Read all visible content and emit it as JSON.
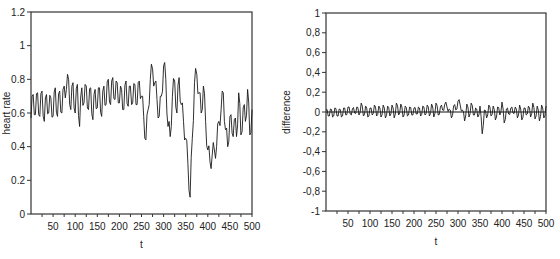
{
  "chart_data": [
    {
      "type": "line",
      "id": "heart-rate",
      "title": "",
      "xlabel": "t",
      "ylabel": "heart rate",
      "xlim": [
        0,
        500
      ],
      "ylim": [
        0,
        1.2
      ],
      "xticks": [
        50,
        100,
        150,
        200,
        250,
        300,
        350,
        400,
        450,
        500
      ],
      "xminor_step": 25,
      "yticks": [
        0,
        0.2,
        0.4,
        0.6,
        0.8,
        1,
        1.2
      ],
      "ytick_labels": [
        "0",
        "0.2",
        "0.4",
        "0.6",
        "0.8",
        "1",
        "1.2"
      ],
      "grid": false,
      "frame": {
        "left": 31,
        "top": 12,
        "right": 252,
        "bottom": 214
      },
      "series": [
        {
          "name": "heart rate",
          "x": [
            0,
            5,
            10,
            15,
            20,
            25,
            30,
            35,
            40,
            45,
            50,
            55,
            60,
            65,
            70,
            75,
            80,
            85,
            90,
            95,
            100,
            105,
            110,
            115,
            120,
            125,
            130,
            135,
            140,
            145,
            150,
            155,
            160,
            165,
            170,
            175,
            180,
            185,
            190,
            195,
            200,
            205,
            210,
            215,
            220,
            225,
            230,
            235,
            240,
            245,
            250,
            255,
            260,
            265,
            270,
            275,
            280,
            285,
            290,
            295,
            300,
            305,
            310,
            315,
            320,
            325,
            330,
            335,
            340,
            345,
            350,
            355,
            360,
            365,
            370,
            375,
            380,
            385,
            390,
            395,
            400,
            405,
            410,
            415,
            420,
            425,
            430,
            435,
            440,
            445,
            450,
            455,
            460,
            465,
            470,
            475,
            480,
            485,
            490,
            495,
            500
          ],
          "values": [
            0.57,
            0.71,
            0.59,
            0.72,
            0.58,
            0.73,
            0.55,
            0.71,
            0.6,
            0.69,
            0.58,
            0.75,
            0.58,
            0.73,
            0.6,
            0.76,
            0.74,
            0.8,
            0.62,
            0.78,
            0.6,
            0.77,
            0.52,
            0.75,
            0.66,
            0.76,
            0.62,
            0.75,
            0.56,
            0.74,
            0.63,
            0.75,
            0.58,
            0.76,
            0.65,
            0.8,
            0.65,
            0.81,
            0.68,
            0.78,
            0.66,
            0.74,
            0.62,
            0.79,
            0.64,
            0.76,
            0.66,
            0.77,
            0.65,
            0.79,
            0.7,
            0.58,
            0.44,
            0.62,
            0.8,
            0.86,
            0.78,
            0.68,
            0.58,
            0.7,
            0.88,
            0.8,
            0.52,
            0.46,
            0.7,
            0.79,
            0.6,
            0.81,
            0.65,
            0.55,
            0.45,
            0.3,
            0.1,
            0.45,
            0.78,
            0.83,
            0.72,
            0.6,
            0.76,
            0.55,
            0.38,
            0.31,
            0.35,
            0.38,
            0.4,
            0.55,
            0.62,
            0.72,
            0.5,
            0.4,
            0.58,
            0.48,
            0.56,
            0.46,
            0.72,
            0.47,
            0.63,
            0.55,
            0.74,
            0.47,
            0.62
          ]
        }
      ]
    },
    {
      "type": "line",
      "id": "difference",
      "title": "",
      "xlabel": "t",
      "ylabel": "difference",
      "xlim": [
        0,
        500
      ],
      "ylim": [
        -1,
        1
      ],
      "xticks": [
        50,
        100,
        150,
        200,
        250,
        300,
        350,
        400,
        450,
        500
      ],
      "xminor_step": 25,
      "yticks": [
        -1,
        -0.8,
        -0.6,
        -0.4,
        -0.2,
        0,
        0.2,
        0.4,
        0.6,
        0.8,
        1
      ],
      "ytick_labels": [
        "-1",
        "-0,8",
        "-0,6",
        "-0,4",
        "-0,2",
        "0",
        "0,2",
        "0,4",
        "0,6",
        "0,8",
        "1"
      ],
      "grid": false,
      "zero_line": true,
      "frame": {
        "left": 46,
        "top": 13,
        "right": 266,
        "bottom": 211
      },
      "series": [
        {
          "name": "difference",
          "x": [
            0,
            5,
            10,
            15,
            20,
            25,
            30,
            35,
            40,
            45,
            50,
            55,
            60,
            65,
            70,
            75,
            80,
            85,
            90,
            95,
            100,
            105,
            110,
            115,
            120,
            125,
            130,
            135,
            140,
            145,
            150,
            155,
            160,
            165,
            170,
            175,
            180,
            185,
            190,
            195,
            200,
            205,
            210,
            215,
            220,
            225,
            230,
            235,
            240,
            245,
            250,
            255,
            260,
            265,
            270,
            275,
            280,
            285,
            290,
            295,
            300,
            305,
            310,
            315,
            320,
            325,
            330,
            335,
            340,
            345,
            350,
            355,
            360,
            365,
            370,
            375,
            380,
            385,
            390,
            395,
            400,
            405,
            410,
            415,
            420,
            425,
            430,
            435,
            440,
            445,
            450,
            455,
            460,
            465,
            470,
            475,
            480,
            485,
            490,
            495,
            500
          ],
          "values": [
            0.02,
            -0.04,
            0.03,
            -0.05,
            0.04,
            -0.04,
            0.03,
            -0.05,
            0.04,
            -0.03,
            0.05,
            -0.02,
            0.03,
            -0.01,
            0.05,
            -0.03,
            0.09,
            -0.04,
            0.06,
            -0.05,
            0.04,
            -0.03,
            0.07,
            -0.04,
            0.06,
            -0.05,
            0.07,
            -0.06,
            0.06,
            -0.04,
            0.07,
            -0.06,
            0.09,
            -0.03,
            0.08,
            -0.05,
            0.06,
            -0.04,
            0.05,
            -0.03,
            0.04,
            -0.02,
            0.05,
            -0.04,
            0.06,
            -0.03,
            0.07,
            -0.04,
            0.08,
            -0.05,
            0.09,
            -0.03,
            0.05,
            0.02,
            0.08,
            0.05,
            0.03,
            -0.06,
            0.06,
            0.02,
            0.11,
            0.07,
            0.02,
            -0.09,
            0.08,
            -0.05,
            0.09,
            -0.03,
            0.04,
            -0.05,
            0.06,
            -0.22,
            0.02,
            -0.06,
            0.07,
            -0.04,
            0.06,
            -0.08,
            0.05,
            -0.03,
            0.1,
            -0.11,
            0.03,
            -0.02,
            0.04,
            -0.01,
            0.05,
            -0.06,
            0.07,
            -0.08,
            0.04,
            -0.03,
            0.06,
            -0.05,
            0.09,
            -0.07,
            0.06,
            -0.09,
            0.07,
            -0.06,
            0.06
          ]
        }
      ]
    }
  ]
}
